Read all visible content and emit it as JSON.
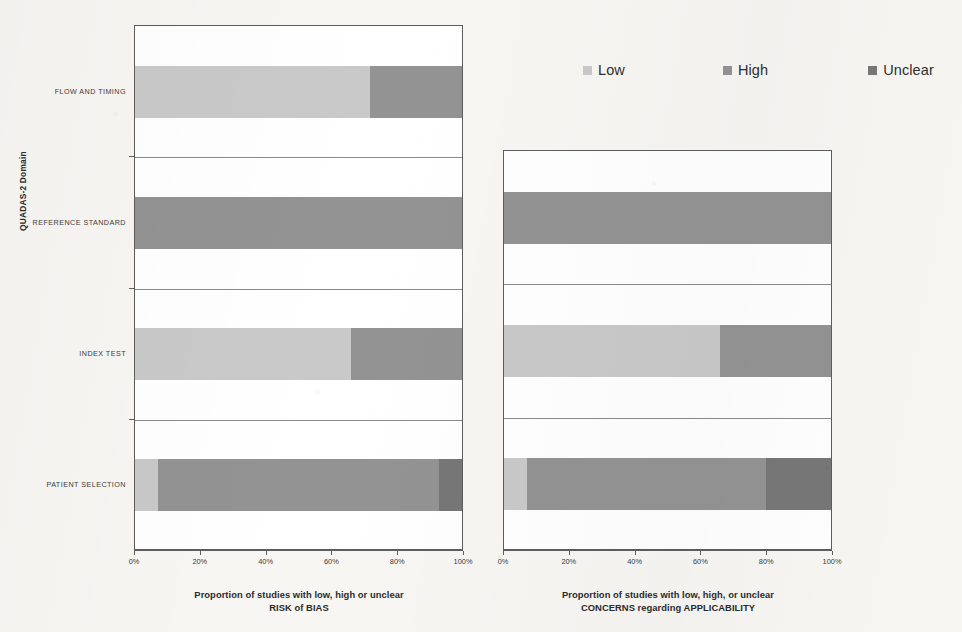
{
  "legend": {
    "items": [
      {
        "label": "Low",
        "key": "low",
        "color": "#c9c9c9",
        "swatch_icon": "legend-swatch-icon"
      },
      {
        "label": "High",
        "key": "high",
        "color": "#939393",
        "swatch_icon": "legend-swatch-icon"
      },
      {
        "label": "Unclear",
        "key": "unclear",
        "color": "#777777",
        "swatch_icon": "legend-swatch-icon"
      }
    ]
  },
  "y_axis": {
    "title": "QUADAS-2 Domain",
    "categories": [
      "PATIENT SELECTION",
      "INDEX TEST",
      "REFERENCE STANDARD",
      "FLOW AND TIMING"
    ]
  },
  "x_axis": {
    "ticks": [
      "0%",
      "20%",
      "40%",
      "60%",
      "80%",
      "100%"
    ],
    "min": 0,
    "max": 100
  },
  "charts": {
    "risk_of_bias": {
      "title_line1": "Proportion of studies with low, high or unclear",
      "title_line2": "RISK of BIAS"
    },
    "applicability": {
      "title_line1": "Proportion of studies with low, high, or unclear",
      "title_line2": "CONCERNS regarding APPLICABILITY"
    }
  },
  "chart_data": [
    {
      "type": "bar",
      "orientation": "horizontal",
      "stacked": true,
      "normalized_percent": true,
      "title": "Proportion of studies with low, high or unclear RISK of BIAS",
      "xlabel": "Proportion of studies with low, high or unclear RISK of BIAS",
      "ylabel": "QUADAS-2 Domain",
      "xlim": [
        0,
        100
      ],
      "xticks": [
        0,
        20,
        40,
        60,
        80,
        100
      ],
      "xticklabels": [
        "0%",
        "20%",
        "40%",
        "60%",
        "80%",
        "100%"
      ],
      "grid": false,
      "legend": [
        "Low",
        "High",
        "Unclear"
      ],
      "legend_position": "top-right",
      "categories": [
        "PATIENT SELECTION",
        "INDEX TEST",
        "REFERENCE STANDARD",
        "FLOW AND TIMING"
      ],
      "series": [
        {
          "name": "Low",
          "color": "#c9c9c9",
          "values": [
            7,
            66,
            0,
            72
          ]
        },
        {
          "name": "High",
          "color": "#939393",
          "values": [
            86,
            34,
            100,
            28
          ]
        },
        {
          "name": "Unclear",
          "color": "#777777",
          "values": [
            7,
            0,
            0,
            0
          ]
        }
      ]
    },
    {
      "type": "bar",
      "orientation": "horizontal",
      "stacked": true,
      "normalized_percent": true,
      "title": "Proportion of studies with low, high, or unclear CONCERNS regarding APPLICABILITY",
      "xlabel": "Proportion of studies with low, high, or unclear CONCERNS regarding APPLICABILITY",
      "ylabel": "QUADAS-2 Domain",
      "xlim": [
        0,
        100
      ],
      "xticks": [
        0,
        20,
        40,
        60,
        80,
        100
      ],
      "xticklabels": [
        "0%",
        "20%",
        "40%",
        "60%",
        "80%",
        "100%"
      ],
      "grid": false,
      "legend": [
        "Low",
        "High",
        "Unclear"
      ],
      "legend_position": "top-right",
      "categories": [
        "PATIENT SELECTION",
        "INDEX TEST",
        "REFERENCE STANDARD"
      ],
      "series": [
        {
          "name": "Low",
          "color": "#c9c9c9",
          "values": [
            7,
            66,
            0
          ]
        },
        {
          "name": "High",
          "color": "#939393",
          "values": [
            73,
            34,
            100
          ]
        },
        {
          "name": "Unclear",
          "color": "#777777",
          "values": [
            20,
            0,
            0
          ]
        }
      ]
    }
  ]
}
